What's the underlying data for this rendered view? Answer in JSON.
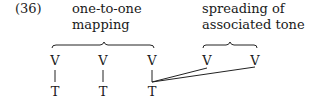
{
  "example": {
    "number": "(36)",
    "label_left": [
      "one-to-one",
      "mapping"
    ],
    "label_right": [
      "spreading of",
      "associated tone"
    ],
    "v_row": [
      "V",
      "V",
      "V",
      "V",
      "V"
    ],
    "t_row": [
      "T",
      "T",
      "T"
    ]
  }
}
